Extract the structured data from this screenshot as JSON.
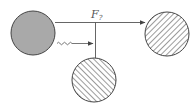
{
  "diagram": {
    "type": "feynman-style particle diagram",
    "label": {
      "main": "F",
      "subscript": "?"
    },
    "nodes": [
      {
        "id": "source",
        "style": "filled-grey",
        "cx": 33,
        "cy": 33,
        "r": 22,
        "fill": "#a9a9a9"
      },
      {
        "id": "target-right",
        "style": "hatched-backslash",
        "cx": 167,
        "cy": 34,
        "r": 22
      },
      {
        "id": "target-bottom",
        "style": "hatched-slash",
        "cx": 94,
        "cy": 80,
        "r": 22
      }
    ],
    "edges": [
      {
        "id": "main-line",
        "from": "source",
        "to": "target-right",
        "style": "straight-arrow"
      },
      {
        "id": "branch-line",
        "from": "junction",
        "to": "target-bottom",
        "style": "straight"
      },
      {
        "id": "wavy-line",
        "from": "source",
        "to": "junction",
        "style": "wavy-arrow"
      }
    ],
    "colors": {
      "stroke": "#444444",
      "grey_fill": "#a9a9a9",
      "hatch": "#666666"
    }
  }
}
